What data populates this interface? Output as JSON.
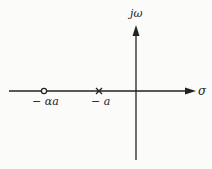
{
  "diagram": {
    "type": "s-plane pole-zero plot",
    "axes": {
      "vertical_label": "jω",
      "horizontal_label": "σ"
    },
    "markers": [
      {
        "kind": "zero",
        "symbol": "circle",
        "label": "− αa"
      },
      {
        "kind": "pole",
        "symbol": "cross",
        "label": "− a"
      }
    ],
    "colors": {
      "background": "#fbfbf9",
      "ink": "#222222"
    }
  }
}
